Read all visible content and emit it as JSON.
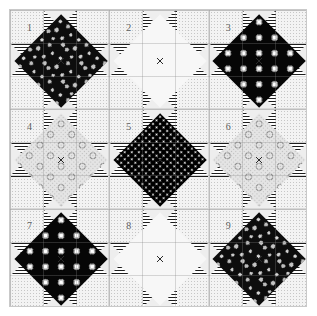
{
  "diagram": {
    "grid": {
      "rows": 3,
      "cols": 3
    },
    "canvas": {
      "width": 317,
      "height": 316
    },
    "quilt_area": {
      "x": 9,
      "y": 9,
      "width": 298,
      "height": 298
    },
    "colors": {
      "background": "#ffffff",
      "border": "#c9c9c9",
      "block_outline": "#d8d8d8",
      "sashing_stripe_dark": "#1d1d1d",
      "sashing_stripe_light": "#ffffff",
      "star_point": "#eeeeee",
      "corner_square": "#f3f3f3",
      "number_text": "#5d5d5d"
    },
    "fabric_legend": [
      {
        "key": "mottled",
        "name": "dark mottled splotch print",
        "value": "#0d0d0d"
      },
      {
        "key": "flower",
        "name": "black ground light flower print",
        "value": "#060606"
      },
      {
        "key": "dotdark",
        "name": "black with white pin dots",
        "value": "#000000"
      },
      {
        "key": "circles",
        "name": "light grey open circle print",
        "value": "#e4e4e4"
      },
      {
        "key": "pale",
        "name": "near-white speckle",
        "value": "#f7f7f7"
      }
    ],
    "blocks": [
      {
        "number": "1",
        "fabric": "mottled",
        "row": 1,
        "col": 1
      },
      {
        "number": "2",
        "fabric": "pale",
        "row": 1,
        "col": 2
      },
      {
        "number": "3",
        "fabric": "flower",
        "row": 1,
        "col": 3
      },
      {
        "number": "4",
        "fabric": "circles",
        "row": 2,
        "col": 1
      },
      {
        "number": "5",
        "fabric": "dotdark",
        "row": 2,
        "col": 2
      },
      {
        "number": "6",
        "fabric": "circles",
        "row": 2,
        "col": 3
      },
      {
        "number": "7",
        "fabric": "flower",
        "row": 3,
        "col": 1
      },
      {
        "number": "8",
        "fabric": "pale",
        "row": 3,
        "col": 2
      },
      {
        "number": "9",
        "fabric": "mottled",
        "row": 3,
        "col": 3
      }
    ]
  }
}
